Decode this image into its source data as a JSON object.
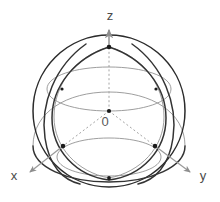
{
  "figure": {
    "background_color": "#ffffff",
    "width": 220,
    "height": 202
  },
  "colors": {
    "sphere_outline": "#2b2b2b",
    "great_circle_front": "#333333",
    "great_circle_back": "#8d8d8d",
    "axis_line": "#9a9a9a",
    "axis_dashed": "#8e8e8e",
    "label_text": "#4a4a4a",
    "node_dot": "#1a1a1a"
  },
  "geometry": {
    "center_x": 109,
    "center_y": 111,
    "radius": 76
  },
  "axes": [
    {
      "id": "z",
      "label": "z",
      "label_x": 110,
      "label_y": 20,
      "direction": "up",
      "x1": 109,
      "y1": 111,
      "x2": 109,
      "y2": 28,
      "style": "solid-with-dashed-interior",
      "arrow": true
    },
    {
      "id": "x",
      "label": "x",
      "label_x": 14,
      "label_y": 180,
      "direction": "down-left",
      "x1": 109,
      "y1": 111,
      "x2": 26,
      "y2": 174,
      "style": "solid-with-dashed-interior",
      "arrow": true
    },
    {
      "id": "y",
      "label": "y",
      "label_x": 203,
      "label_y": 180,
      "direction": "down-right",
      "x1": 109,
      "y1": 111,
      "x2": 192,
      "y2": 174,
      "style": "solid-with-dashed-interior",
      "arrow": true
    }
  ],
  "origin": {
    "label": "0",
    "label_x": 104,
    "label_y": 124,
    "dot_x": 109,
    "dot_y": 111
  },
  "nodes": [
    {
      "id": "north-pole",
      "x": 109,
      "y": 47
    },
    {
      "id": "x-axis-surface",
      "x": 63,
      "y": 146
    },
    {
      "id": "y-axis-surface",
      "x": 155,
      "y": 146
    },
    {
      "id": "south-front",
      "x": 109,
      "y": 178
    },
    {
      "id": "left-upper-cross",
      "x": 62,
      "y": 89
    },
    {
      "id": "right-upper-cross",
      "x": 156,
      "y": 89
    }
  ],
  "great_circles": [
    {
      "id": "sphere-outline",
      "kind": "silhouette",
      "visible": "full"
    },
    {
      "id": "equator",
      "kind": "tilted-ellipse",
      "visible": "front-solid-back-light"
    },
    {
      "id": "meridian-a",
      "kind": "tilted-ellipse",
      "visible": "front-solid-back-light"
    },
    {
      "id": "meridian-b",
      "kind": "tilted-ellipse",
      "visible": "front-solid-back-light"
    },
    {
      "id": "upper-small-circle",
      "kind": "horizontal-ellipse",
      "visible": "light"
    },
    {
      "id": "lower-small-circle",
      "kind": "horizontal-ellipse",
      "visible": "light"
    }
  ]
}
